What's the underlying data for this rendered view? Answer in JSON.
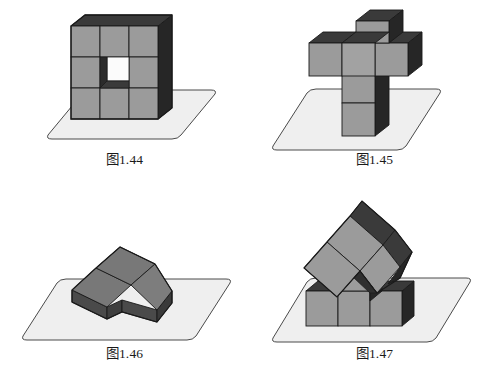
{
  "page": {
    "background_color": "#ffffff",
    "width": 499,
    "height": 380
  },
  "palette": {
    "cube_front": "#9b9b9b",
    "cube_front_alt": "#a2a2a2",
    "cube_top_dark": "#3a3a3a",
    "cube_side_dark": "#262626",
    "cube_flat_top": "#787878",
    "cube_flat_side": "#4a4a4a",
    "ground_fill": "#efefef",
    "ground_stroke": "#4a4a4a",
    "outline": "#1a1a1a",
    "hole_back": "#fbfbfb",
    "caption_color": "#1a1a1a"
  },
  "figures": [
    {
      "id": "fig-144",
      "caption": "图1.44",
      "description": "3 by 3 wall of cubes with the centre cube removed",
      "cube_count": 8,
      "arrangement": "3x3 vertical wall, centre hole",
      "ground": "parallelogram platform with rounded corners"
    },
    {
      "id": "fig-145",
      "caption": "图1.45",
      "description": "Plus-shaped layer of cubes resting on a two-cube column",
      "cube_count": 6,
      "arrangement": "cross of 4 cubes on top, column of 2 cubes below",
      "ground": "parallelogram platform with rounded corners"
    },
    {
      "id": "fig-146",
      "caption": "图1.46",
      "description": "Three cubes laid flat forming an L shape, rotated about 45 degrees",
      "cube_count": 3,
      "arrangement": "flat L-tromino",
      "ground": "parallelogram platform with rounded corners"
    },
    {
      "id": "fig-147",
      "caption": "图1.47",
      "description": "Tilted three-cube group balanced on a T shaped base of cubes",
      "cube_count": 7,
      "arrangement": "row of 3 cubes with a centre cube on top, tilted cluster above",
      "ground": "parallelogram platform with rounded corners"
    }
  ]
}
